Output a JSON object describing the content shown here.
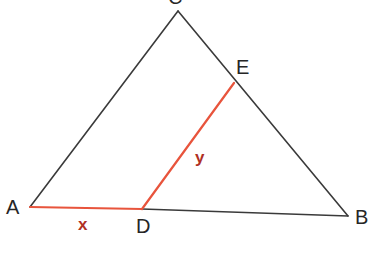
{
  "figure": {
    "kind": "euclidean-geometry-diagram",
    "background_color": "#ffffff",
    "width": 376,
    "height": 274
  },
  "colors": {
    "outline": "#3a3a3a",
    "highlight_line": "#e8543c",
    "highlight_label": "#b03024",
    "vertex_label": "#262626"
  },
  "points": {
    "C": {
      "label": "C",
      "x": 178,
      "y": 11,
      "clipped_at_top": true
    },
    "A": {
      "label": "A",
      "x": 30,
      "y": 207
    },
    "B": {
      "label": "B",
      "x": 348,
      "y": 216
    },
    "D": {
      "label": "D",
      "x": 142,
      "y": 209
    },
    "E": {
      "label": "E",
      "x": 234,
      "y": 83
    }
  },
  "edges": [
    {
      "name": "side-AC",
      "from": "A",
      "to": "C",
      "color": "#3a3a3a",
      "width": 1.6
    },
    {
      "name": "side-CB",
      "from": "C",
      "to": "B",
      "color": "#3a3a3a",
      "width": 1.6
    },
    {
      "name": "side-DB",
      "from": "D",
      "to": "B",
      "color": "#3a3a3a",
      "width": 1.6
    },
    {
      "name": "segment-AD",
      "from": "A",
      "to": "D",
      "color": "#e8543c",
      "width": 2.2
    },
    {
      "name": "segment-DE",
      "from": "D",
      "to": "E",
      "color": "#e8543c",
      "width": 2.2
    }
  ],
  "segment_labels": {
    "x": {
      "text": "x",
      "for_edge": "segment-AD",
      "x": 85,
      "y": 224,
      "color": "#b03024"
    },
    "y": {
      "text": "y",
      "for_edge": "segment-DE",
      "x": 200,
      "y": 157,
      "color": "#b03024"
    }
  }
}
